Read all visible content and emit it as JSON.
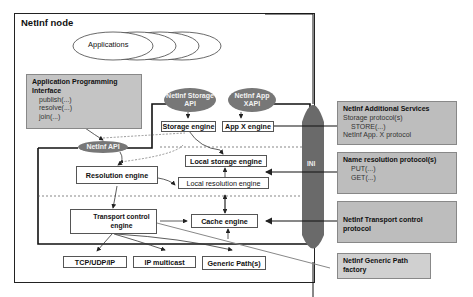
{
  "diagram": {
    "title": "NetInf node",
    "applications": {
      "label": "Applications",
      "stack_count": 4
    },
    "api_box": {
      "heading": "Application Programming Interface",
      "items": [
        "publish(...)",
        "resolve(...)",
        "join(...)",
        "..."
      ]
    },
    "apis": {
      "storage_api": "NetInf Storage API",
      "app_x_api": "NetInf App XAPI",
      "netinf_api": "NetInf API"
    },
    "engines": {
      "storage_engine": "Storage engine",
      "app_x_engine": "App X engine",
      "local_storage_engine": "Local storage engine",
      "resolution_engine": "Resolution engine",
      "local_resolution_engine": "Local resolution engine",
      "transport_control_engine": "Transport control engine",
      "cache_engine": "Cache engine"
    },
    "transports": [
      "TCP/UDP/IP",
      "IP multicast",
      "Generic Path(s)"
    ],
    "ini_label": "INI",
    "external": {
      "additional_services": {
        "heading": "NetInf Additional Services",
        "lines": [
          "Storage protocol(s)",
          "STORE(...)",
          "NetInf App. X protocol"
        ]
      },
      "name_resolution": {
        "heading": "Name resolution protocol(s)",
        "lines": [
          "PUT(...)",
          "GET(...)",
          "..."
        ]
      },
      "transport_control": {
        "heading": "NetInf Transport control protocol"
      },
      "generic_path_factory": {
        "heading": "NetInf Generic Path factory"
      }
    },
    "colors": {
      "api_ellipse": "#777777",
      "ini": "#6a6a6a",
      "external_box": "#bdbdbd",
      "api_box": "#c4c4c4"
    }
  }
}
